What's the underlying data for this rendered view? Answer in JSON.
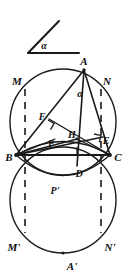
{
  "figure": {
    "canvas": {
      "width": 132,
      "height": 280
    },
    "stroke_color": "#1a1a1a",
    "background_color": "#ffffff"
  },
  "angle_gadget": {
    "name": "standalone-angle",
    "vertex": {
      "x": 28,
      "y": 53
    },
    "ray_horizontal_end": {
      "x": 79,
      "y": 53
    },
    "ray_slanted_end": {
      "x": 59,
      "y": 21
    },
    "label": "α",
    "label_pos": {
      "x": 44,
      "y": 49
    }
  },
  "circles": [
    {
      "name": "upper-circle",
      "cx": 63,
      "cy": 122,
      "r": 53
    },
    {
      "name": "lower-circle",
      "cx": 63,
      "cy": 200,
      "r": 53
    }
  ],
  "points": [
    {
      "id": "A",
      "label": "A",
      "x": 84,
      "y": 70,
      "label_x": 84,
      "label_y": 65
    },
    {
      "id": "B",
      "label": "B",
      "x": 16,
      "y": 155,
      "label_x": 9,
      "label_y": 160
    },
    {
      "id": "C",
      "label": "C",
      "x": 110,
      "y": 155,
      "label_x": 116,
      "label_y": 160
    },
    {
      "id": "D",
      "label": "D",
      "x": 77,
      "y": 164,
      "label_x": 79,
      "label_y": 176
    },
    {
      "id": "E",
      "label": "E",
      "x": 101,
      "y": 139,
      "label_x": 104,
      "label_y": 144
    },
    {
      "id": "F",
      "label": "F",
      "x": 53,
      "y": 123,
      "label_x": 42,
      "label_y": 119
    },
    {
      "id": "H",
      "label": "H",
      "x": 77,
      "y": 139,
      "label_x": 72,
      "label_y": 137
    },
    {
      "id": "M",
      "label": "M",
      "x": 25,
      "y": 89,
      "label_x": 16,
      "label_y": 84
    },
    {
      "id": "N",
      "label": "N",
      "x": 101,
      "y": 89,
      "label_x": 104,
      "label_y": 84
    },
    {
      "id": "P",
      "label": "P",
      "x": 55,
      "y": 141,
      "label_x": 51,
      "label_y": 145
    },
    {
      "id": "Pp",
      "label": "P'",
      "x": 57,
      "y": 180,
      "label_x": 54,
      "label_y": 193
    },
    {
      "id": "Mp",
      "label": "M'",
      "x": 25,
      "y": 233,
      "label_x": 15,
      "label_y": 250
    },
    {
      "id": "Np",
      "label": "N'",
      "x": 101,
      "y": 233,
      "label_x": 104,
      "label_y": 250
    },
    {
      "id": "Ap",
      "label": "A'",
      "x": 63,
      "y": 253,
      "label_x": 72,
      "label_y": 269
    }
  ],
  "inner_angle": {
    "label": "α",
    "label_x": 80,
    "label_y": 96,
    "at_vertex": "A"
  },
  "solid_segments": [
    {
      "name": "segment-A-B",
      "from": "A",
      "to": "B"
    },
    {
      "name": "segment-A-C",
      "from": "A",
      "to": "C"
    },
    {
      "name": "segment-B-C",
      "from": "B",
      "to": "C"
    },
    {
      "name": "segment-A-D",
      "from": "A",
      "to": "D"
    },
    {
      "name": "segment-B-E",
      "from": "B",
      "to": "E"
    },
    {
      "name": "segment-C-F",
      "from": "C",
      "to": "F"
    },
    {
      "name": "segment-B-H",
      "from": "B",
      "to": "H"
    },
    {
      "name": "segment-H-C",
      "from": "H",
      "to": "C"
    },
    {
      "name": "segment-B-P",
      "from": "B",
      "to": "P"
    }
  ],
  "dashed_chords": [
    {
      "name": "chord-M-Mprime",
      "from": "M",
      "to": "Mp"
    },
    {
      "name": "chord-N-Nprime",
      "from": "N",
      "to": "Np"
    }
  ],
  "right_angle_marks": [
    {
      "name": "right-angle-at-F",
      "x": 53,
      "y": 123,
      "rotation": -40
    },
    {
      "name": "right-angle-at-E",
      "x": 101,
      "y": 139,
      "rotation": 205
    },
    {
      "name": "right-angle-at-D",
      "x": 77,
      "y": 164,
      "rotation": 90
    }
  ],
  "arcs": [
    {
      "name": "arc-B-P-C-upper",
      "from": "B",
      "to": "C",
      "bulge": "down-small"
    },
    {
      "name": "arc-B-Pprime-C",
      "from": "B",
      "to": "C",
      "bulge": "down-large"
    }
  ]
}
